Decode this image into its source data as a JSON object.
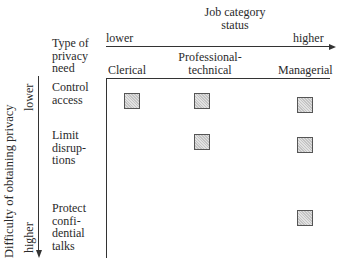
{
  "x_axis": {
    "title_line1": "Job category",
    "title_line2": "status",
    "low_label": "lower",
    "high_label": "higher",
    "columns": [
      {
        "line1": "",
        "line2": "Clerical"
      },
      {
        "line1": "Professional-",
        "line2": "technical"
      },
      {
        "line1": "",
        "line2": "Managerial"
      }
    ]
  },
  "y_axis": {
    "title": "Difficulty of obtaining privacy",
    "low_label": "lower",
    "high_label": "higher",
    "header_line1": "Type of",
    "header_line2": "privacy",
    "header_line3": "need",
    "rows": [
      {
        "lines": [
          "Control",
          "access"
        ]
      },
      {
        "lines": [
          "Limit",
          "disrup-",
          "tions"
        ]
      },
      {
        "lines": [
          "Protect",
          "confi-",
          "dential",
          "talks"
        ]
      }
    ]
  },
  "matrix": {
    "marker": "shaded-square",
    "cells": [
      {
        "row": "Control access",
        "column": "Clerical",
        "marked": true
      },
      {
        "row": "Control access",
        "column": "Professional-technical",
        "marked": true
      },
      {
        "row": "Control access",
        "column": "Managerial",
        "marked": true
      },
      {
        "row": "Limit disruptions",
        "column": "Clerical",
        "marked": false
      },
      {
        "row": "Limit disruptions",
        "column": "Professional-technical",
        "marked": true
      },
      {
        "row": "Limit disruptions",
        "column": "Managerial",
        "marked": true
      },
      {
        "row": "Protect confidential talks",
        "column": "Clerical",
        "marked": false
      },
      {
        "row": "Protect confidential talks",
        "column": "Professional-technical",
        "marked": false
      },
      {
        "row": "Protect confidential talks",
        "column": "Managerial",
        "marked": true
      }
    ]
  },
  "colors": {
    "ink": "#333333",
    "marker_fill": "#d8d8d8",
    "marker_border": "#555555"
  }
}
